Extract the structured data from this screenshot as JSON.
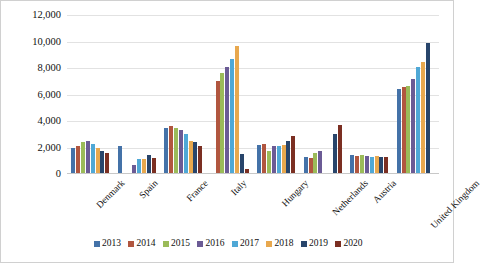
{
  "chart_data": {
    "type": "bar",
    "title": "",
    "xlabel": "",
    "ylabel": "",
    "ylim": [
      0,
      12000
    ],
    "ytick_values": [
      0,
      2000,
      4000,
      6000,
      8000,
      10000,
      12000
    ],
    "ytick_labels": [
      "0",
      "2,000",
      "4,000",
      "6,000",
      "8,000",
      "10,000",
      "12,000"
    ],
    "grid": true,
    "legend_position": "bottom",
    "categories": [
      "Denmark",
      "Spain",
      "France",
      "Italy",
      "Hungary",
      "Netherlands",
      "Austria",
      "United Kingdom"
    ],
    "series": [
      {
        "name": "2013",
        "color": "#4472a8",
        "values": [
          2000,
          2150,
          3500,
          null,
          2200,
          1250,
          1450,
          6400
        ]
      },
      {
        "name": "2014",
        "color": "#b1563f",
        "values": [
          2150,
          null,
          3600,
          7000,
          2250,
          1200,
          1350,
          6550
        ]
      },
      {
        "name": "2015",
        "color": "#9bbb59",
        "values": [
          2400,
          null,
          3450,
          7650,
          1750,
          1550,
          1400,
          6650
        ]
      },
      {
        "name": "2016",
        "color": "#6b5b95",
        "values": [
          2500,
          650,
          3300,
          8100,
          2100,
          1700,
          1350,
          7200
        ]
      },
      {
        "name": "2017",
        "color": "#4fa8d6",
        "values": [
          2250,
          1150,
          3050,
          8700,
          2150,
          null,
          1300,
          8100
        ]
      },
      {
        "name": "2018",
        "color": "#e8a84e",
        "values": [
          1950,
          1100,
          2500,
          9650,
          2200,
          null,
          1350,
          8450
        ]
      },
      {
        "name": "2019",
        "color": "#28456b",
        "values": [
          1750,
          1400,
          2450,
          1500,
          2500,
          3000,
          1250,
          9900
        ]
      },
      {
        "name": "2020",
        "color": "#7b2f22",
        "values": [
          1550,
          1200,
          2150,
          400,
          2900,
          3700,
          1300,
          null
        ]
      }
    ]
  },
  "legend": {
    "items": [
      {
        "label": "2013"
      },
      {
        "label": "2014"
      },
      {
        "label": "2015"
      },
      {
        "label": "2016"
      },
      {
        "label": "2017"
      },
      {
        "label": "2018"
      },
      {
        "label": "2019"
      },
      {
        "label": "2020"
      }
    ]
  }
}
